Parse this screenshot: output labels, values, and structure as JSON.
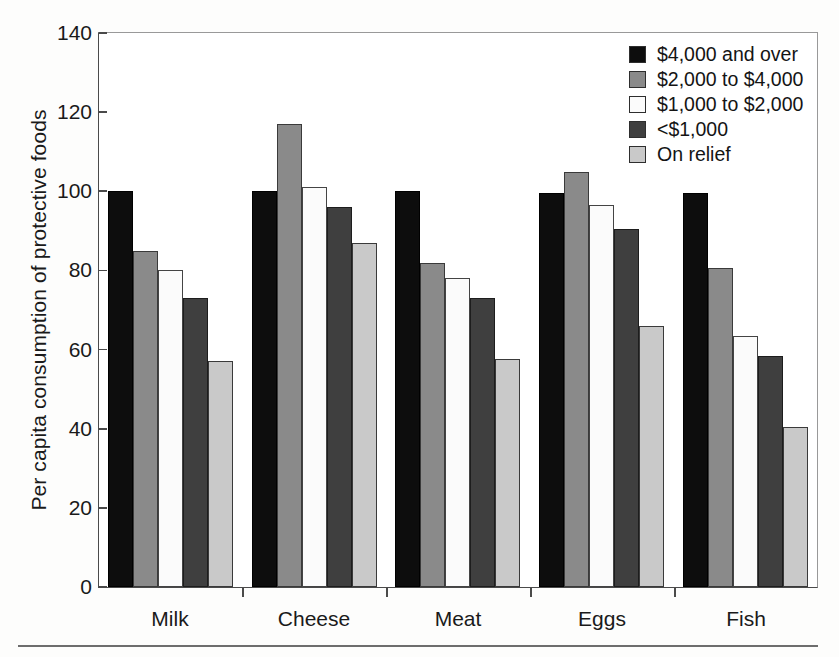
{
  "chart_data": {
    "type": "bar",
    "title": "",
    "xlabel": "",
    "ylabel": "Per capita consumption of protective foods",
    "ylim": [
      0,
      140
    ],
    "yticks": [
      0,
      20,
      40,
      60,
      80,
      100,
      120,
      140
    ],
    "grid": false,
    "legend_position": "top-right",
    "categories": [
      "Milk",
      "Cheese",
      "Meat",
      "Eggs",
      "Fish"
    ],
    "series": [
      {
        "name": "$4,000 and over",
        "color": "#0d0d0d",
        "values": [
          100,
          100,
          100,
          99.5,
          99.5
        ]
      },
      {
        "name": "$2,000 to $4,000",
        "color": "#8a8a8a",
        "values": [
          85,
          117,
          82,
          105,
          80.5
        ]
      },
      {
        "name": "$1,000 to $2,000",
        "color": "#fbfbfb",
        "values": [
          80,
          101,
          78,
          96.5,
          63.5
        ]
      },
      {
        "name": "<$1,000",
        "color": "#3f3f3f",
        "values": [
          73,
          96,
          73,
          90.5,
          58.5
        ]
      },
      {
        "name": "On relief",
        "color": "#c9c9c9",
        "values": [
          57,
          87,
          57.5,
          66,
          40.5
        ]
      }
    ]
  },
  "axis": {
    "ytick_labels": [
      "140",
      "120",
      "100",
      "80",
      "60",
      "40",
      "20",
      "0"
    ],
    "ylabel_text": "Per capita consumption of protective foods",
    "xtick_labels": [
      "Milk",
      "Cheese",
      "Meat",
      "Eggs",
      "Fish"
    ]
  },
  "legend": {
    "items": [
      {
        "label": "$4,000 and over"
      },
      {
        "label": "$2,000 to $4,000"
      },
      {
        "label": "$1,000 to $2,000"
      },
      {
        "label": "<$1,000"
      },
      {
        "label": "On relief"
      }
    ]
  }
}
